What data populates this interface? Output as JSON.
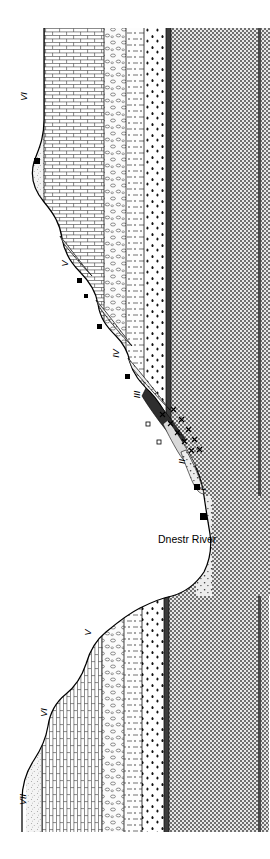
{
  "figure": {
    "kind": "geological-cross-section",
    "orientation_note": "cross-section drawn rotated 90 degrees; labels read bottom-to-top",
    "river_label": "Dnestr River",
    "background_color": "#ffffff",
    "ink_color": "#000000"
  },
  "terrace_labels": [
    {
      "id": "terrace-vi-upper",
      "text": "VI",
      "x": 26,
      "y": 98
    },
    {
      "id": "terrace-v-upper",
      "text": "V",
      "x": 67,
      "y": 265
    },
    {
      "id": "terrace-iv",
      "text": "IV",
      "x": 119,
      "y": 355
    },
    {
      "id": "terrace-iii",
      "text": "III",
      "x": 141,
      "y": 396
    },
    {
      "id": "terrace-ii",
      "text": "II",
      "x": 186,
      "y": 463
    },
    {
      "id": "terrace-i",
      "text": "I",
      "x": 206,
      "y": 491
    },
    {
      "id": "terrace-v-lower",
      "text": "V",
      "x": 90,
      "y": 634
    },
    {
      "id": "terrace-vi-lower",
      "text": "VI",
      "x": 46,
      "y": 714
    },
    {
      "id": "terrace-vii",
      "text": "VII",
      "x": 26,
      "y": 801
    }
  ],
  "river": {
    "label_x": 158,
    "label_y": 540
  },
  "stratigraphy": {
    "units": [
      {
        "name": "loess-cap",
        "pattern": "fine-stipple",
        "fill": "#f2f2f2"
      },
      {
        "name": "limestone",
        "pattern": "brick",
        "fill": "#ffffff"
      },
      {
        "name": "conglomerate",
        "pattern": "pebble-circles",
        "fill": "#fafafa"
      },
      {
        "name": "marl",
        "pattern": "dash-dot",
        "fill": "#fbfbfb"
      },
      {
        "name": "clay-shale",
        "pattern": "dark-flecks",
        "fill": "#ffffff"
      },
      {
        "name": "dark-marker-band",
        "pattern": "solid-dark",
        "fill": "#4a4a4a"
      },
      {
        "name": "crystalline-basement",
        "pattern": "checkerboard",
        "fill": "#9a9a9a"
      }
    ]
  },
  "site_markers": {
    "symbol": "black-square",
    "description": "filled square marks archaeological find-spot",
    "points": [
      {
        "x": 37,
        "y": 161
      },
      {
        "x": 80,
        "y": 281
      },
      {
        "x": 86,
        "y": 297
      },
      {
        "x": 100,
        "y": 327
      },
      {
        "x": 128,
        "y": 377
      },
      {
        "x": 148,
        "y": 425
      },
      {
        "x": 159,
        "y": 443
      },
      {
        "x": 196,
        "y": 487
      },
      {
        "x": 203,
        "y": 516
      }
    ]
  },
  "artifact_markers": {
    "symbol": "cross-star",
    "description": "small crosses mark gravel / artifact-bearing lenses in terrace fill",
    "points": [
      {
        "x": 163,
        "y": 416
      },
      {
        "x": 170,
        "y": 424
      },
      {
        "x": 176,
        "y": 432
      },
      {
        "x": 182,
        "y": 440
      },
      {
        "x": 188,
        "y": 448
      },
      {
        "x": 194,
        "y": 456
      },
      {
        "x": 172,
        "y": 410
      },
      {
        "x": 180,
        "y": 419
      },
      {
        "x": 187,
        "y": 428
      },
      {
        "x": 193,
        "y": 438
      },
      {
        "x": 199,
        "y": 447
      },
      {
        "x": 200,
        "y": 462
      }
    ]
  }
}
